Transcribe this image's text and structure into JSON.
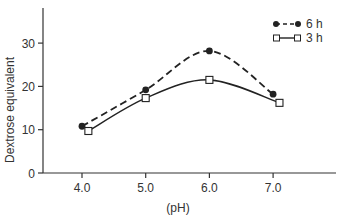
{
  "chart_data": {
    "type": "line",
    "title": "",
    "xlabel": "(pH)",
    "ylabel": "Dextrose equivalent",
    "xlim": [
      3.7,
      7.95
    ],
    "ylim": [
      0,
      38
    ],
    "x_ticks": [
      4.0,
      5.0,
      6.0,
      7.0
    ],
    "x_tick_labels": [
      "4.0",
      "5.0",
      "6.0",
      "7.0"
    ],
    "y_ticks": [
      0,
      10,
      20,
      30
    ],
    "y_tick_labels": [
      "0",
      "10",
      "20",
      "30"
    ],
    "grid": false,
    "legend_position": "top-right",
    "series": [
      {
        "name": "6h",
        "label": "6 h",
        "marker": "filled-circle",
        "line_style": "dashed",
        "x": [
          4.0,
          5.0,
          6.0,
          7.0
        ],
        "values": [
          10.8,
          19.2,
          28.2,
          18.2
        ]
      },
      {
        "name": "3h",
        "label": "3 h",
        "marker": "open-square",
        "line_style": "solid",
        "x": [
          4.1,
          5.0,
          6.0,
          7.1
        ],
        "values": [
          9.7,
          17.3,
          21.5,
          16.2
        ]
      }
    ]
  },
  "colors": {
    "axis": "#333333",
    "series_6h": "#222222",
    "series_3h": "#222222",
    "background": "#ffffff"
  }
}
